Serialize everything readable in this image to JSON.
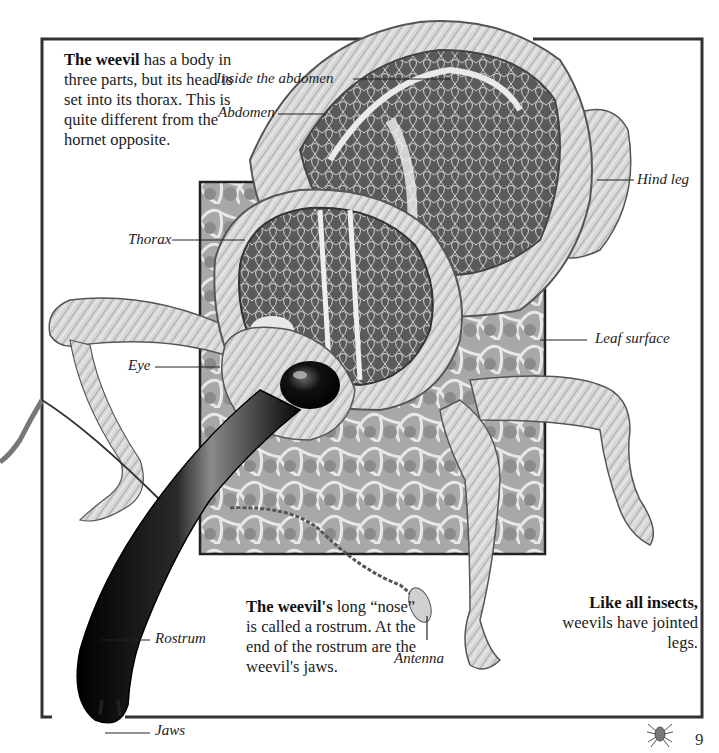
{
  "page": {
    "number": "9",
    "footer_icon": "spider-icon"
  },
  "text_blocks": {
    "intro": {
      "bold": "The weevil",
      "rest": " has a body in three parts, but its head is set into its thorax. This is quite different from the hornet opposite."
    },
    "rostrum": {
      "bold": "The weevil's",
      "rest": " long “nose” is called a rostrum. At the end of the rostrum are the weevil's jaws."
    },
    "legs": {
      "bold": "Like all insects,",
      "rest": " weevils have jointed legs."
    }
  },
  "labels": {
    "inside_abdomen": "Inside the abdomen",
    "abdomen": "Abdomen",
    "hind_leg": "Hind leg",
    "thorax": "Thorax",
    "leaf_surface": "Leaf surface",
    "eye": "Eye",
    "rostrum": "Rostrum",
    "antenna": "Antenna",
    "jaws": "Jaws"
  },
  "colors": {
    "frame": "#333333",
    "leaf_panel": "#9a9a9a",
    "rostrum": "#111111",
    "text": "#222222"
  }
}
